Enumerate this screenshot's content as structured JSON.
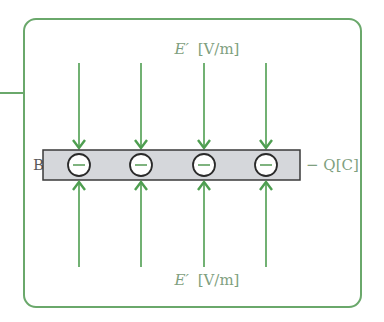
{
  "diagram": {
    "colors": {
      "frame": "#6aa86b",
      "arrow": "#4e9e50",
      "bar_fill": "#d5d7db",
      "bar_stroke": "#3a3a3a",
      "charge_stroke": "#2a2a2a",
      "minus": "#5fa060",
      "label": "#7f9f80"
    },
    "top_label": {
      "symbol": "E′",
      "unit": "[V/m]"
    },
    "bottom_label": {
      "symbol": "E′",
      "unit": "[V/m]"
    },
    "plate": {
      "name": "B",
      "charge_label": "− Q[C]"
    },
    "charges": [
      {
        "sign": "−",
        "x": 79
      },
      {
        "sign": "−",
        "x": 141
      },
      {
        "sign": "−",
        "x": 204
      },
      {
        "sign": "−",
        "x": 266
      }
    ],
    "field_line_count_top": 4,
    "field_line_count_bottom": 4
  }
}
